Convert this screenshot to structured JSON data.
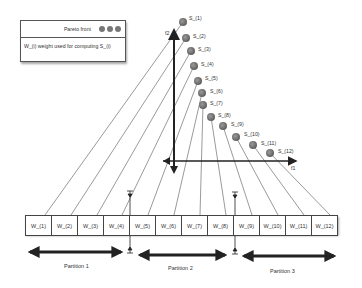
{
  "legend": {
    "pareto_label": "Pareto front",
    "weight_label": "W_(i) weight used for computing S_(i)",
    "dot_color": "#777777"
  },
  "axes": {
    "x_label": "f1",
    "y_label": "f2"
  },
  "pareto_points": [
    {
      "label": "S_(1)",
      "x": 183,
      "y": 22
    },
    {
      "label": "S_(2)",
      "x": 186,
      "y": 38
    },
    {
      "label": "S_(3)",
      "x": 191,
      "y": 51
    },
    {
      "label": "S_(4)",
      "x": 194,
      "y": 66
    },
    {
      "label": "S_(5)",
      "x": 198,
      "y": 81
    },
    {
      "label": "S_(6)",
      "x": 202,
      "y": 93
    },
    {
      "label": "S_(7)",
      "x": 203,
      "y": 105
    },
    {
      "label": "S_(8)",
      "x": 211,
      "y": 117
    },
    {
      "label": "S_(9)",
      "x": 223,
      "y": 126
    },
    {
      "label": "S_(10)",
      "x": 236,
      "y": 137
    },
    {
      "label": "S_(11)",
      "x": 253,
      "y": 145
    },
    {
      "label": "S_(12)",
      "x": 270,
      "y": 153
    }
  ],
  "weights": [
    "W_(1)",
    "W_(2)",
    "W_(3)",
    "W_(4)",
    "W_(5)",
    "W_(6)",
    "W_(7)",
    "W_(8)",
    "W_(9)",
    "W_(10)",
    "W_(11)",
    "W_(12)"
  ],
  "partitions": [
    {
      "label": "Partition 1"
    },
    {
      "label": "Partition 2"
    },
    {
      "label": "Partition 3"
    }
  ]
}
